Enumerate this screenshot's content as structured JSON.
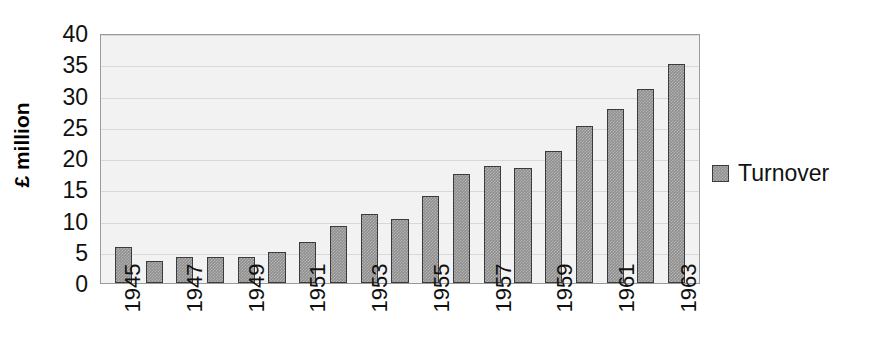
{
  "chart_data": {
    "type": "bar",
    "title": "",
    "xlabel": "",
    "ylabel": "£ million",
    "ylim": [
      0,
      40
    ],
    "yticks": [
      0,
      5,
      10,
      15,
      20,
      25,
      30,
      35,
      40
    ],
    "grid": true,
    "legend_position": "right",
    "series_name": "Turnover",
    "bar_color": "#8f8f8f",
    "bar_border_color": "#3b3b3b",
    "plot_background": "#f2f2f2",
    "categories": [
      "1945",
      "1946",
      "1947",
      "1948",
      "1949",
      "1950",
      "1951",
      "1952",
      "1953",
      "1954",
      "1955",
      "1956",
      "1957",
      "1958",
      "1959",
      "1960",
      "1961",
      "1962",
      "1963"
    ],
    "tick_labels": [
      "1945",
      "",
      "1947",
      "",
      "1949",
      "",
      "1951",
      "",
      "1953",
      "",
      "1955",
      "",
      "1957",
      "",
      "1959",
      "",
      "1961",
      "",
      "1963"
    ],
    "values": [
      5.7,
      3.5,
      4.2,
      4.2,
      4.2,
      4.9,
      6.6,
      9.2,
      11.0,
      10.2,
      13.9,
      17.5,
      18.8,
      18.4,
      21.2,
      25.2,
      27.8,
      31.0,
      35.0
    ],
    "series": [
      {
        "name": "Turnover",
        "values": [
          5.7,
          3.5,
          4.2,
          4.2,
          4.2,
          4.9,
          6.6,
          9.2,
          11.0,
          10.2,
          13.9,
          17.5,
          18.8,
          18.4,
          21.2,
          25.2,
          27.8,
          31.0,
          35.0
        ]
      }
    ]
  },
  "legend": {
    "entries": [
      {
        "label": "Turnover"
      }
    ]
  }
}
